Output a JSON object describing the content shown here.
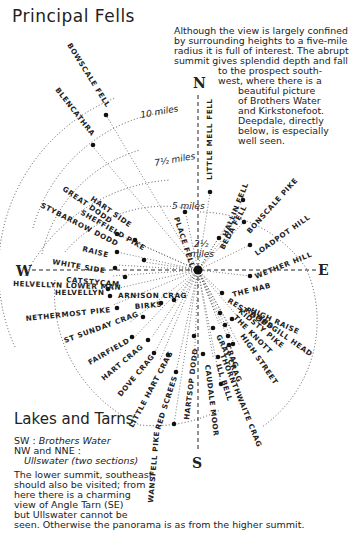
{
  "title": "Principal Fells",
  "intro_lines": [
    "Although the view is largely confined",
    "by surrounding heights to a five-mile",
    "radius it is full of interest. The abrupt",
    "summit gives splendid depth and fall",
    "to the prospect south-",
    "west, where there is a",
    "beautiful picture",
    "of Brothers Water",
    "and Kirkstonefoot.",
    "Deepdale, directly",
    "below, is especially",
    "well seen."
  ],
  "compass": {
    "north": "N",
    "south": "S",
    "east": "E",
    "west": "W"
  },
  "distance_rings": {
    "ring_10": "10 miles",
    "ring_7_5": "7½ miles",
    "ring_5": "5 miles",
    "ring_2_5_num": "2½",
    "ring_2_5_unit": "miles"
  },
  "fells": [
    "BOWSCALE FELL",
    "BLENCATHRA",
    "HART SIDE",
    "GREAT DODD",
    "SHEFFIELD PIKE",
    "STYBARROW DODD",
    "RAISE",
    "WHITE SIDE",
    "CATSTYCAM",
    "HELVELLYN LOWER MAN",
    "HELVELLYN",
    "ARNISON CRAG",
    "BIRKS",
    "NETHERMOST PIKE",
    "ST SUNDAY CRAG",
    "FAIRFIELD",
    "HART CRAG",
    "DOVE CRAG",
    "LITTLE HART CRAG",
    "RED SCREES",
    "WANSFELL PIKE",
    "HARTSOP DODD",
    "CAUDALE MOOR",
    "CRAG",
    "THORNTHWAITE CRAG",
    "ILL BELL",
    "GRAY CRAG",
    "HIGH STREET",
    "THE KNOTT",
    "KIDSTY PIKE",
    "RAMPSGILL HEAD",
    "REST DODD",
    "HIGH RAISE",
    "THE NAB",
    "WETHER HILL",
    "LOADPOT HILL",
    "BONSCALE PIKE",
    "BEDA FELL",
    "HALLIN FELL",
    "PLACE FELL",
    "LITTLE MELL FELL"
  ],
  "lakes": {
    "title": "Lakes and Tarns",
    "line1_dir": "SW :",
    "line1_name": "Brothers Water",
    "line2": "NW and NNE :",
    "line3_name": "Ullswater",
    "line3_note": "(two sections)"
  },
  "note_lines": [
    "The lower summit, southeast,",
    "should also be visited; from",
    "here there is a charming",
    "view of Angle Tarn (SE)",
    "but Ullswater cannot be",
    "seen. Otherwise the panorama is as from the higher summit."
  ]
}
